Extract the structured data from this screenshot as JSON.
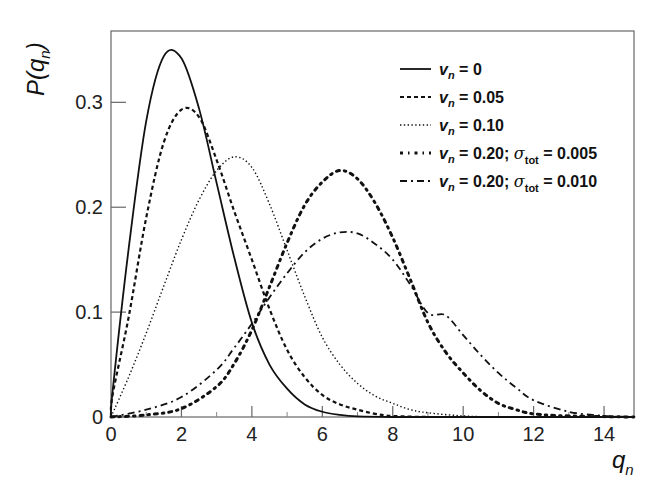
{
  "chart_data": {
    "type": "line",
    "title": "",
    "xlabel": "q_n",
    "ylabel": "P(q_n)",
    "xlim": [
      0,
      14.85
    ],
    "ylim": [
      0,
      0.368
    ],
    "xticks": [
      0,
      2,
      4,
      6,
      8,
      10,
      12,
      14
    ],
    "yticks": [
      0,
      0.1,
      0.2,
      0.3
    ],
    "xtick_labels": [
      "0",
      "2",
      "4",
      "6",
      "8",
      "10",
      "12",
      "14"
    ],
    "ytick_labels": [
      "0",
      "0.1",
      "0.2",
      "0.3"
    ],
    "grid": false,
    "legend_position": "upper right",
    "series": [
      {
        "name": "v_n = 0",
        "legend": {
          "v": "v",
          "sub": "n",
          "rest": " = 0",
          "sigma": null
        },
        "style": "solid",
        "x": [
          0,
          0.05,
          0.5,
          1,
          1.5,
          2,
          2.5,
          3,
          3.5,
          4,
          4.5,
          5,
          5.5,
          6,
          6.5,
          7,
          8,
          9,
          10,
          12,
          14.85
        ],
        "y": [
          0.0,
          0.026,
          0.16,
          0.282,
          0.344,
          0.342,
          0.294,
          0.223,
          0.152,
          0.09,
          0.05,
          0.027,
          0.012,
          0.005,
          0.002,
          0.0006,
          0.0,
          0.0,
          0.0,
          0.0,
          0.0
        ]
      },
      {
        "name": "v_n = 0.05",
        "legend": {
          "v": "v",
          "sub": "n",
          "rest": " = 0.05",
          "sigma": null
        },
        "style": "dashed",
        "x": [
          0,
          0.05,
          0.5,
          1,
          1.5,
          2,
          2.5,
          3,
          3.5,
          4,
          4.5,
          5,
          5.5,
          6,
          6.5,
          7,
          7.5,
          8,
          9,
          10,
          12,
          14.85
        ],
        "y": [
          0.0,
          0.022,
          0.095,
          0.19,
          0.262,
          0.293,
          0.286,
          0.245,
          0.196,
          0.15,
          0.103,
          0.064,
          0.038,
          0.021,
          0.012,
          0.007,
          0.003,
          0.001,
          0.0,
          0.0,
          0.0,
          0.0
        ]
      },
      {
        "name": "v_n = 0.10",
        "legend": {
          "v": "v",
          "sub": "n",
          "rest": " = 0.10",
          "sigma": null
        },
        "style": "dotted",
        "x": [
          0,
          0.5,
          1,
          1.5,
          2,
          2.5,
          3,
          3.5,
          4,
          4.5,
          5,
          5.5,
          6,
          6.5,
          7,
          7.5,
          8,
          8.5,
          9,
          10,
          11,
          12,
          14.85
        ],
        "y": [
          0.0,
          0.038,
          0.08,
          0.125,
          0.169,
          0.207,
          0.235,
          0.248,
          0.238,
          0.203,
          0.159,
          0.115,
          0.076,
          0.05,
          0.032,
          0.02,
          0.013,
          0.007,
          0.004,
          0.001,
          0.0,
          0.0,
          0.0
        ]
      },
      {
        "name": "v_n = 0.20; sigma_tot = 0.005",
        "legend": {
          "v": "v",
          "sub": "n",
          "rest": " = 0.20; ",
          "sigma": {
            "sym": "σ",
            "sub": "tot",
            "rest": " = 0.005"
          }
        },
        "style": "dense-dash-dot",
        "x": [
          0,
          1,
          2,
          3,
          3.5,
          4,
          4.5,
          5,
          5.5,
          6,
          6.5,
          7,
          7.5,
          8,
          8.5,
          9,
          9.5,
          10,
          10.5,
          11,
          11.5,
          12,
          13,
          14.85
        ],
        "y": [
          0.0,
          0.002,
          0.008,
          0.029,
          0.051,
          0.083,
          0.124,
          0.166,
          0.202,
          0.224,
          0.235,
          0.227,
          0.204,
          0.171,
          0.131,
          0.09,
          0.062,
          0.042,
          0.025,
          0.013,
          0.007,
          0.003,
          0.001,
          0.0
        ]
      },
      {
        "name": "v_n = 0.20; sigma_tot = 0.010",
        "legend": {
          "v": "v",
          "sub": "n",
          "rest": " = 0.20; ",
          "sigma": {
            "sym": "σ",
            "sub": "tot",
            "rest": " = 0.010"
          }
        },
        "style": "long-dash-dot",
        "x": [
          0,
          1,
          2,
          3,
          3.5,
          4,
          4.5,
          5,
          5.5,
          6,
          6.5,
          7,
          7.5,
          8,
          8.5,
          9,
          9.5,
          10,
          10.5,
          11,
          11.5,
          12,
          13,
          14,
          14.85
        ],
        "y": [
          0.0,
          0.007,
          0.019,
          0.045,
          0.066,
          0.089,
          0.114,
          0.137,
          0.157,
          0.17,
          0.176,
          0.175,
          0.165,
          0.15,
          0.126,
          0.099,
          0.097,
          0.078,
          0.059,
          0.042,
          0.028,
          0.016,
          0.005,
          0.001,
          0.0
        ]
      }
    ]
  }
}
